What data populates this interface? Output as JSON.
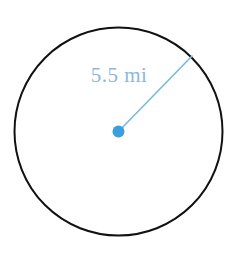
{
  "figure": {
    "background_color": "#ffffff",
    "canvas": {
      "width": 236,
      "height": 255
    }
  },
  "circle": {
    "name": "circle-outline",
    "center_x": 118.5,
    "center_y": 131.5,
    "radius": 104,
    "stroke_color": "#111111",
    "stroke_width": 2,
    "fill_color": "#ffffff"
  },
  "center_point": {
    "name": "center-point-dot",
    "x": 118.5,
    "y": 131.5,
    "dot_radius": 6,
    "color": "#3b9fdc"
  },
  "radius_line": {
    "name": "radius-segment",
    "x1": 118.5,
    "y1": 131.5,
    "x2": 192,
    "y2": 56,
    "color": "#76b9e3",
    "stroke_width": 1.6
  },
  "radius_label": {
    "text": "5.5 mi",
    "value": "5.5",
    "unit": "mi",
    "x": 119,
    "y": 82,
    "color": "#8bb7de",
    "font_size": 21
  }
}
